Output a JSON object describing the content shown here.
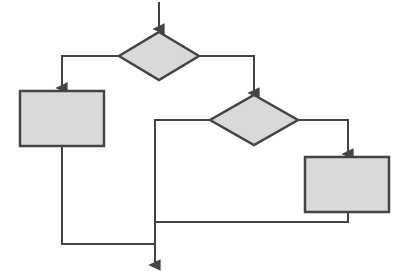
{
  "diagram": {
    "type": "flowchart",
    "canvas": {
      "width": 406,
      "height": 271,
      "background": "#ffffff"
    },
    "style": {
      "node_fill": "#d9d9d9",
      "node_stroke": "#444444",
      "node_stroke_width": 2.5,
      "connector_stroke": "#444444",
      "connector_stroke_width": 2,
      "arrowhead_color": "#444444"
    },
    "nodes": [
      {
        "id": "decision-1",
        "name": "decision-diamond-top",
        "shape": "diamond",
        "label": "",
        "cx": 159,
        "cy": 56,
        "half_width": 40,
        "half_height": 24
      },
      {
        "id": "process-1",
        "name": "process-box-left",
        "shape": "rectangle",
        "label": "",
        "x": 20,
        "y": 91,
        "width": 84,
        "height": 55
      },
      {
        "id": "decision-2",
        "name": "decision-diamond-middle",
        "shape": "diamond",
        "label": "",
        "cx": 254,
        "cy": 120,
        "half_width": 44,
        "half_height": 25
      },
      {
        "id": "process-2",
        "name": "process-box-right",
        "shape": "rectangle",
        "label": "",
        "x": 305,
        "y": 157,
        "width": 84,
        "height": 55
      }
    ],
    "connectors": [
      {
        "id": "conn-entry",
        "name": "connector-entry-to-decision-1",
        "points": "159,2 159,29",
        "arrow": true
      },
      {
        "id": "conn-d1-left",
        "name": "connector-decision-1-to-process-left",
        "points": "119,56 62,56 62,88",
        "arrow": true
      },
      {
        "id": "conn-d1-right",
        "name": "connector-decision-1-to-decision-2",
        "points": "199,56 254,56 254,93",
        "arrow": true
      },
      {
        "id": "conn-d2-left",
        "name": "connector-decision-2-to-merge",
        "points": "210,120 155,120 155,222",
        "arrow": false
      },
      {
        "id": "conn-d2-right",
        "name": "connector-decision-2-to-process-right",
        "points": "298,120 348,120 348,154",
        "arrow": true
      },
      {
        "id": "conn-p2-merge",
        "name": "connector-process-right-to-merge",
        "points": "348,212 348,222 155,222",
        "arrow": false
      },
      {
        "id": "conn-merge-down",
        "name": "connector-merge-to-exit-line",
        "points": "155,222 155,244",
        "arrow": false
      },
      {
        "id": "conn-p1-bottom",
        "name": "connector-process-left-to-exit",
        "points": "62,146 62,244 155,244",
        "arrow": false
      },
      {
        "id": "conn-exit",
        "name": "connector-exit-arrow",
        "points": "155,244 155,265",
        "arrow": true
      }
    ]
  }
}
